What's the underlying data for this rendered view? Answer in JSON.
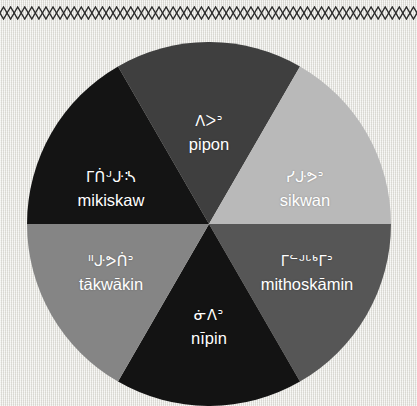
{
  "border": {
    "pattern_name": "diamond-chain-border",
    "color": "#2b2b2b",
    "repeat_count": 59
  },
  "wheel": {
    "name": "seasons-wheel",
    "center_x": 182,
    "center_y": 182,
    "radius": 182,
    "sector_count": 6,
    "sectors": [
      {
        "id": "pipon",
        "syllabics": "ᐱᐳᐣ",
        "roman": "pipon",
        "color": "#3f3f3f",
        "start_angle": -30,
        "end_angle": 30
      },
      {
        "id": "sikwan",
        "syllabics": "ᓯᒙᕗᐣ",
        "roman": "sikwan",
        "color": "#b9b9b9",
        "start_angle": 30,
        "end_angle": 90
      },
      {
        "id": "mithoskamin",
        "syllabics": "ᒥᓪᒢᒡᒃᒥᐣ",
        "roman": "mithoskāmin",
        "color": "#565656",
        "start_angle": 90,
        "end_angle": 150
      },
      {
        "id": "nipin",
        "syllabics": "ᓃᐱᐣ",
        "roman": "nīpin",
        "color": "#131313",
        "start_angle": 150,
        "end_angle": 210
      },
      {
        "id": "takwakin",
        "syllabics": "ᐦᒙᕗᑏᐣ",
        "roman": "tākwākin",
        "color": "#858585",
        "start_angle": 210,
        "end_angle": 270
      },
      {
        "id": "mikiskaw",
        "syllabics": "ᒥᑏᒢᒙᔄ",
        "roman": "mikiskaw",
        "color": "#141414",
        "start_angle": 270,
        "end_angle": 330
      }
    ]
  },
  "colors": {
    "background": "#e9e8e4",
    "label_text": "#ffffff",
    "border_ink": "#2b2b2b"
  }
}
